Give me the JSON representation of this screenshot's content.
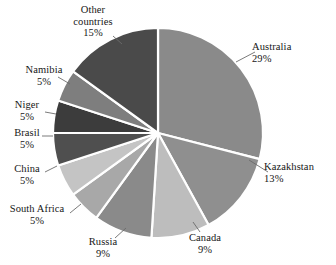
{
  "chart_data": {
    "type": "pie",
    "title": "",
    "subtitle": "",
    "legend_position": "callout-labels",
    "grid": false,
    "total_percent": 100,
    "value_suffix": "%",
    "start_angle_deg": 0,
    "direction": "clockwise",
    "categories": [
      "Australia",
      "Kazakhstan",
      "Canada",
      "Russia",
      "South Africa",
      "China",
      "Brasil",
      "Niger",
      "Namibia",
      "Other countries"
    ],
    "values": [
      29,
      13,
      9,
      9,
      5,
      5,
      5,
      5,
      5,
      15
    ],
    "slices": [
      {
        "label": "Australia",
        "value": 29,
        "value_text": "29%",
        "color": "#8a8a8a"
      },
      {
        "label": "Kazakhstan",
        "value": 13,
        "value_text": "13%",
        "color": "#8f8f8f"
      },
      {
        "label": "Canada",
        "value": 9,
        "value_text": "9%",
        "color": "#bdbdbd"
      },
      {
        "label": "Russia",
        "value": 9,
        "value_text": "9%",
        "color": "#8a8a8a"
      },
      {
        "label": "South Africa",
        "value": 5,
        "value_text": "5%",
        "color": "#a8a8a8"
      },
      {
        "label": "China",
        "value": 5,
        "value_text": "5%",
        "color": "#c4c4c4"
      },
      {
        "label": "Brasil",
        "value": 5,
        "value_text": "5%",
        "color": "#4f4f4f"
      },
      {
        "label": "Niger",
        "value": 5,
        "value_text": "5%",
        "color": "#3c3c3c"
      },
      {
        "label": "Namibia",
        "value": 5,
        "value_text": "5%",
        "color": "#7e7e7e"
      },
      {
        "label": "Other countries",
        "value": 15,
        "value_text": "15%",
        "color": "#4a4a4a"
      }
    ]
  },
  "labels": {
    "australia": {
      "name": "Australia",
      "value": "29%"
    },
    "kazakhstan": {
      "name": "Kazakhstan",
      "value": "13%"
    },
    "canada": {
      "name": "Canada",
      "value": "9%"
    },
    "russia": {
      "name": "Russia",
      "value": "9%"
    },
    "south_africa": {
      "name": "South Africa",
      "value": "5%"
    },
    "china": {
      "name": "China",
      "value": "5%"
    },
    "brasil": {
      "name": "Brasil",
      "value": "5%"
    },
    "niger": {
      "name": "Niger",
      "value": "5%"
    },
    "namibia": {
      "name": "Namibia",
      "value": "5%"
    },
    "other_countries": {
      "name_line1": "Other",
      "name_line2": "countries",
      "value": "15%"
    }
  },
  "geometry": {
    "center_x": 158,
    "center_y": 133,
    "radius": 105
  },
  "colors": {
    "separator": "#ffffff",
    "leader": "#6b6b6b",
    "text": "#161616",
    "background": "#ffffff"
  }
}
